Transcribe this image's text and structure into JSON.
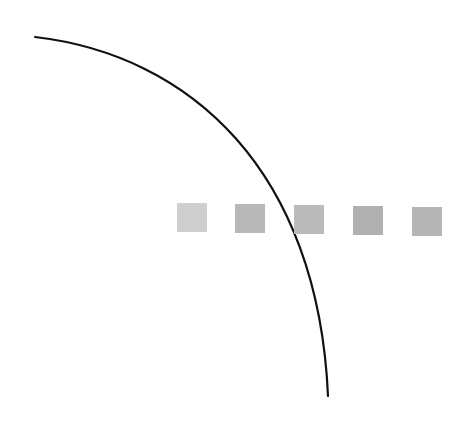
{
  "canvas": {
    "width": 476,
    "height": 429,
    "background": "#ffffff"
  },
  "curve": {
    "path": "M35,37 C190,55 318,170 328,396",
    "stroke": "#111111",
    "stroke_width": 2.2
  },
  "squares": [
    {
      "x": 177,
      "y": 203,
      "color": "#cfcfcf"
    },
    {
      "x": 235,
      "y": 204,
      "color": "#b8b8b8"
    },
    {
      "x": 294,
      "y": 205,
      "color": "#bbbbbb"
    },
    {
      "x": 353,
      "y": 206,
      "color": "#b0b0b0"
    },
    {
      "x": 412,
      "y": 207,
      "color": "#b5b5b5"
    }
  ]
}
